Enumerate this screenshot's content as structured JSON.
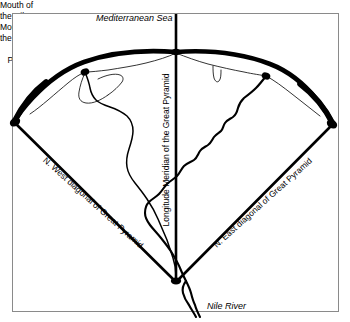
{
  "figure": {
    "kind": "map-diagram",
    "title_visible": false,
    "frame": {
      "stroke": "#8a8a8a",
      "fill": "#ffffff"
    },
    "ink_color": "#000000"
  },
  "labels": {
    "mediterranean_sea": "Mediterranean Sea",
    "mouth_of_the_nile_west_line1": "Mouth of",
    "mouth_of_the_nile_west_line2": "the Nile",
    "mouth_of_the_nile_east_line1": "Mouth of",
    "mouth_of_the_nile_east_line2": "the Nile",
    "longitude_meridian": "Longitude Meridian of the Great Pyramid",
    "nw_diagonal": "N. West diagonal of Great Pyramid",
    "ne_diagonal": "N. East diagonal of Great Pyramid",
    "great_pyramid_line1": "Great",
    "great_pyramid_line2": "Pyramid",
    "nile_river": "Nile River"
  },
  "geometry": {
    "apex_x": 176,
    "apex_y": 282,
    "arc_left_vertex_x": 14,
    "arc_left_vertex_y": 122,
    "arc_right_vertex_x": 333,
    "arc_right_vertex_y": 124,
    "arc_apex_x": 176,
    "arc_apex_y": 52,
    "meridian_top_y": 14,
    "meridian_bottom_y": 282,
    "nw_mouth_x": 84,
    "nw_mouth_y": 72,
    "ne_mouth_x": 266,
    "ne_mouth_y": 75
  }
}
